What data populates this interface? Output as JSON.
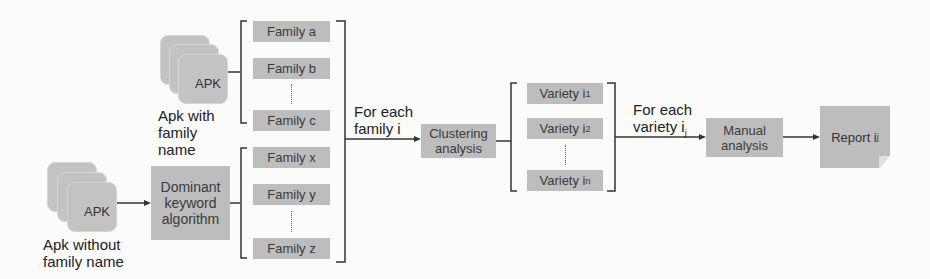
{
  "diagram": {
    "type": "flowchart",
    "inputs": {
      "labeled_apk": {
        "tile_label": "APK",
        "caption_lines": [
          "Apk with",
          "family",
          "name"
        ]
      },
      "unlabeled_apk": {
        "tile_label": "APK",
        "caption_lines": [
          "Apk without",
          "family name"
        ]
      }
    },
    "dominant_keyword": {
      "lines": [
        "Dominant",
        "keyword",
        "algorithm"
      ]
    },
    "families_known": [
      "Family a",
      "Family b",
      "Family c"
    ],
    "families_inferred": [
      "Family x",
      "Family y",
      "Family z"
    ],
    "for_each_family": {
      "lines": [
        "For each",
        "family i"
      ]
    },
    "clustering": {
      "lines": [
        "Clustering",
        "analysis"
      ]
    },
    "varieties": [
      {
        "base": "Variety i",
        "sub": "1"
      },
      {
        "base": "Variety i",
        "sub": "2"
      },
      {
        "base": "Variety i",
        "sub": "n"
      }
    ],
    "for_each_variety": {
      "line1": "For each",
      "line2_base": "variety i",
      "line2_sub": "j"
    },
    "manual": {
      "lines": [
        "Manual",
        "analysis"
      ]
    },
    "report": {
      "base": "Report i",
      "sub": "j"
    },
    "colors": {
      "box_fill": "#bdbdbd",
      "line": "#333333",
      "background": "#fbfbfa"
    }
  }
}
